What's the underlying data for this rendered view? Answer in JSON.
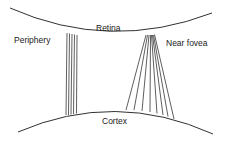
{
  "labels": {
    "retina": "Retina",
    "periphery": "Periphery",
    "near_fovea": "Near fovea",
    "cortex": "Cortex"
  },
  "colors": {
    "stroke": "#1a1a1a",
    "background": "#ffffff"
  },
  "retina_curve": {
    "start": [
      10,
      8
    ],
    "control": [
      110,
      52
    ],
    "end": [
      212,
      13
    ]
  },
  "cortex_curve": {
    "start": [
      18,
      132
    ],
    "control": [
      115,
      90
    ],
    "end": [
      213,
      134
    ]
  },
  "periphery_lines": [
    {
      "x1": 67,
      "y1": 33,
      "x2": 66,
      "y2": 115
    },
    {
      "x1": 69.5,
      "y1": 33.5,
      "x2": 68.5,
      "y2": 115
    },
    {
      "x1": 72,
      "y1": 34,
      "x2": 71,
      "y2": 114.5
    },
    {
      "x1": 74.5,
      "y1": 34.5,
      "x2": 73.5,
      "y2": 114
    },
    {
      "x1": 77,
      "y1": 35,
      "x2": 76.5,
      "y2": 113.5
    }
  ],
  "near_fovea_lines": [
    {
      "x1": 146,
      "y1": 35,
      "x2": 126,
      "y2": 110
    },
    {
      "x1": 147.5,
      "y1": 35,
      "x2": 134,
      "y2": 110
    },
    {
      "x1": 149,
      "y1": 35,
      "x2": 142,
      "y2": 111
    },
    {
      "x1": 150.5,
      "y1": 35,
      "x2": 150,
      "y2": 112
    },
    {
      "x1": 151.5,
      "y1": 35,
      "x2": 157,
      "y2": 113.5
    },
    {
      "x1": 152.5,
      "y1": 35,
      "x2": 163,
      "y2": 115
    },
    {
      "x1": 153.5,
      "y1": 35,
      "x2": 168,
      "y2": 116.5
    },
    {
      "x1": 154.5,
      "y1": 34.5,
      "x2": 174,
      "y2": 119
    }
  ]
}
